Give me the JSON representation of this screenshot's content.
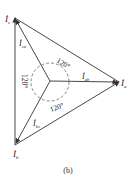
{
  "diagram": {
    "type": "phasor-diagram",
    "caption": "(b)",
    "vertices": {
      "c": {
        "label": "I",
        "sub": "c",
        "x": 15,
        "y": 18
      },
      "a": {
        "label": "I",
        "sub": "a",
        "x": 119,
        "y": 82
      },
      "b": {
        "label": "I",
        "sub": "b",
        "x": 15,
        "y": 145
      }
    },
    "center": {
      "x": 50,
      "y": 81
    },
    "internal_phasors": [
      {
        "label": "I",
        "sub": "ca"
      },
      {
        "label": "I",
        "sub": "ab"
      },
      {
        "label": "I",
        "sub": "bc"
      }
    ],
    "angles": [
      "120°",
      "120°",
      "120°"
    ],
    "colors": {
      "line": "#333333",
      "dash": "#555555"
    }
  }
}
